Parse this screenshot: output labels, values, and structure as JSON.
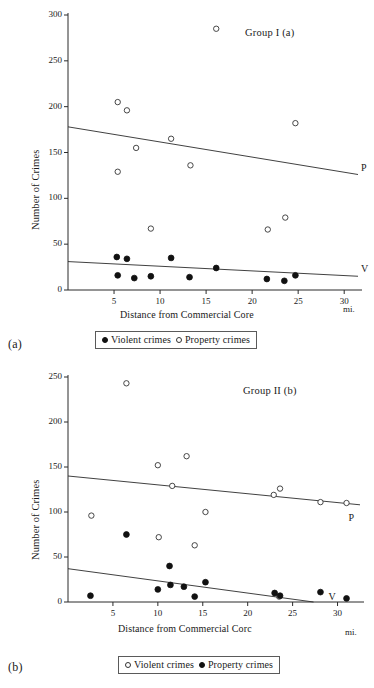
{
  "figure": {
    "panels": [
      {
        "letter": "(a)",
        "group_title": "Group I (a)",
        "xlabel": "Distance from Commercial Core",
        "xunit": "mi.",
        "ylabel": "Number of Crimes",
        "yticks": [
          "0",
          "50",
          "100",
          "150",
          "200",
          "250",
          "300"
        ],
        "xticks": [
          "5",
          "10",
          "15",
          "20",
          "25",
          "30"
        ],
        "line_labels": {
          "property": "P",
          "violent": "V"
        },
        "legend": [
          {
            "marker": "filled-circle",
            "label": "Violent crimes"
          },
          {
            "marker": "open-circle",
            "label": "Property crimes"
          }
        ]
      },
      {
        "letter": "(b)",
        "group_title": "Group II (b)",
        "xlabel": "Distance from Commercial Corc",
        "xunit": "mi.",
        "ylabel": "Number of Crimes",
        "yticks": [
          "0",
          "50",
          "100",
          "150",
          "200",
          "250"
        ],
        "xticks": [
          "5",
          "10",
          "15",
          "20",
          "25",
          "30"
        ],
        "line_labels": {
          "property": "P",
          "violent": "V"
        },
        "legend": [
          {
            "marker": "open-circle",
            "label": "Violent crimes"
          },
          {
            "marker": "filled-circle",
            "label": "Property crimes"
          }
        ]
      }
    ]
  },
  "chart_data": [
    {
      "type": "scatter",
      "title": "Group I (a)",
      "xlabel": "Distance from Commercial Core",
      "xunit": "mi.",
      "ylabel": "Number of Crimes",
      "xlim": [
        0,
        31.5
      ],
      "ylim": [
        0,
        300
      ],
      "xticks": [
        5,
        10,
        15,
        20,
        25,
        30
      ],
      "yticks": [
        0,
        50,
        100,
        150,
        200,
        250,
        300
      ],
      "grid": false,
      "legend_position": "below-axes",
      "series": [
        {
          "name": "Property crimes",
          "marker": "open-circle",
          "points": [
            {
              "x": 5.4,
              "y": 205
            },
            {
              "x": 5.4,
              "y": 129
            },
            {
              "x": 6.4,
              "y": 196
            },
            {
              "x": 7.4,
              "y": 155
            },
            {
              "x": 9.0,
              "y": 67
            },
            {
              "x": 11.2,
              "y": 165
            },
            {
              "x": 13.3,
              "y": 136
            },
            {
              "x": 16.1,
              "y": 285
            },
            {
              "x": 21.7,
              "y": 66
            },
            {
              "x": 23.6,
              "y": 79
            },
            {
              "x": 24.7,
              "y": 182
            }
          ]
        },
        {
          "name": "Violent crimes",
          "marker": "filled-circle",
          "points": [
            {
              "x": 5.3,
              "y": 36
            },
            {
              "x": 5.4,
              "y": 16
            },
            {
              "x": 6.4,
              "y": 34
            },
            {
              "x": 7.2,
              "y": 13
            },
            {
              "x": 9.0,
              "y": 15
            },
            {
              "x": 11.2,
              "y": 35
            },
            {
              "x": 13.2,
              "y": 14
            },
            {
              "x": 16.1,
              "y": 24
            },
            {
              "x": 21.6,
              "y": 12
            },
            {
              "x": 23.5,
              "y": 10
            },
            {
              "x": 24.7,
              "y": 16
            }
          ]
        }
      ],
      "trend_lines": [
        {
          "label": "P",
          "name": "Property crimes trend",
          "x0": 0,
          "y0": 178,
          "x1": 31.5,
          "y1": 126
        },
        {
          "label": "V",
          "name": "Violent crimes trend",
          "x0": 0,
          "y0": 31,
          "x1": 31.5,
          "y1": 15
        }
      ]
    },
    {
      "type": "scatter",
      "title": "Group II (b)",
      "xlabel": "Distance from Commercial Corc",
      "xunit": "mi.",
      "ylabel": "Number of Crimes",
      "xlim": [
        0,
        32.5
      ],
      "ylim": [
        0,
        250
      ],
      "xticks": [
        5,
        10,
        15,
        20,
        25,
        30
      ],
      "yticks": [
        0,
        50,
        100,
        150,
        200,
        250
      ],
      "grid": false,
      "legend_position": "below-axes",
      "series": [
        {
          "name": "Violent crimes",
          "marker": "open-circle",
          "points": [
            {
              "x": 2.6,
              "y": 96
            },
            {
              "x": 6.5,
              "y": 243
            },
            {
              "x": 10.0,
              "y": 152
            },
            {
              "x": 10.1,
              "y": 72
            },
            {
              "x": 11.6,
              "y": 129
            },
            {
              "x": 13.2,
              "y": 162
            },
            {
              "x": 14.1,
              "y": 63
            },
            {
              "x": 15.3,
              "y": 100
            },
            {
              "x": 22.9,
              "y": 119
            },
            {
              "x": 23.6,
              "y": 126
            },
            {
              "x": 23.5,
              "y": 6
            },
            {
              "x": 28.1,
              "y": 111
            },
            {
              "x": 31.0,
              "y": 110
            }
          ]
        },
        {
          "name": "Property crimes",
          "marker": "filled-circle",
          "points": [
            {
              "x": 2.5,
              "y": 7
            },
            {
              "x": 6.5,
              "y": 75
            },
            {
              "x": 10.0,
              "y": 14
            },
            {
              "x": 11.3,
              "y": 40
            },
            {
              "x": 11.4,
              "y": 19
            },
            {
              "x": 12.9,
              "y": 17
            },
            {
              "x": 14.1,
              "y": 6
            },
            {
              "x": 15.3,
              "y": 22
            },
            {
              "x": 23.0,
              "y": 10
            },
            {
              "x": 23.6,
              "y": 7
            },
            {
              "x": 28.1,
              "y": 11
            },
            {
              "x": 31.0,
              "y": 4
            }
          ]
        }
      ],
      "trend_lines": [
        {
          "label": "P",
          "name": "Property crimes trend",
          "x0": 0,
          "y0": 140,
          "x1": 32.5,
          "y1": 108
        },
        {
          "label": "V",
          "name": "Violent crimes trend",
          "x0": 0,
          "y0": 37,
          "x1": 32.5,
          "y1": -7
        }
      ]
    }
  ]
}
